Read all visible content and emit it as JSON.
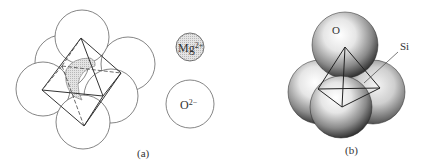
{
  "figure": {
    "panel_a": {
      "caption": "(a)",
      "legend": [
        {
          "label_main": "Mg",
          "label_sup": "2+",
          "fill": "#d8d8d8",
          "description": "hatched small circle"
        },
        {
          "label_main": "O",
          "label_sup": "2−",
          "fill": "#ffffff",
          "description": "large open circle"
        }
      ]
    },
    "panel_b": {
      "caption": "(b)",
      "labels": {
        "oxygen": "O",
        "silicon": "Si"
      }
    }
  },
  "colors": {
    "line": "#555555",
    "hatch": "#d6d6d6",
    "sphere_light": "#ffffff",
    "sphere_dark": "#2a2a2a"
  }
}
